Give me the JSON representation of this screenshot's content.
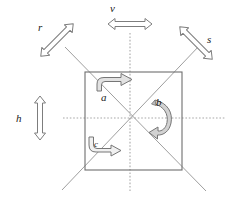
{
  "figure": {
    "type": "geometry-diagram",
    "background_color": "#ffffff",
    "stroke_color": "#555555",
    "axis_color": "#9a9a9a",
    "label_color": "#1a1a1a",
    "arrow_fill": "#ffffff",
    "arrow_stroke": "#777777",
    "curved_arrow_fill": "#cfcfcf"
  },
  "labels": {
    "v": "v",
    "h": "h",
    "r": "r",
    "s": "s",
    "a": "a",
    "b": "b",
    "c": "c"
  },
  "elements": {
    "square": {
      "name": "square-outline",
      "x": 85,
      "y": 72,
      "width": 97,
      "height": 98
    },
    "vertical_axis": {
      "name": "vertical-mirror-axis",
      "label": "v",
      "x": 130,
      "y1": 33,
      "y2": 192,
      "style": "dotted"
    },
    "horizontal_axis": {
      "name": "horizontal-mirror-axis",
      "label": "h",
      "y": 118,
      "x1": 63,
      "x2": 226,
      "style": "dotted"
    },
    "diagonal_r": {
      "name": "diagonal-mirror-axis-r",
      "label": "r",
      "x1": 62,
      "y1": 190,
      "x2": 199,
      "y2": 46,
      "style": "solid"
    },
    "diagonal_s": {
      "name": "diagonal-mirror-axis-s",
      "label": "s",
      "x1": 66,
      "y1": 48,
      "x2": 205,
      "y2": 190,
      "style": "solid"
    },
    "arrow_v": {
      "name": "reflection-arrow-v",
      "orientation": "horizontal",
      "cx": 130,
      "cy": 24
    },
    "arrow_h": {
      "name": "reflection-arrow-h",
      "orientation": "vertical",
      "cx": 40,
      "cy": 118
    },
    "arrow_r": {
      "name": "reflection-arrow-r",
      "orientation": "diagonal-ne",
      "cx": 57,
      "cy": 38
    },
    "arrow_s": {
      "name": "reflection-arrow-s",
      "orientation": "diagonal-se",
      "cx": 197,
      "cy": 42
    },
    "rotation_a": {
      "name": "rotation-arrow-a",
      "label": "a",
      "degrees": 90,
      "quadrant": "upper-left"
    },
    "rotation_b": {
      "name": "rotation-arrow-b",
      "label": "b",
      "degrees": 180,
      "quadrant": "right"
    },
    "rotation_c": {
      "name": "rotation-arrow-c",
      "label": "c",
      "degrees": 270,
      "quadrant": "lower-left"
    }
  }
}
